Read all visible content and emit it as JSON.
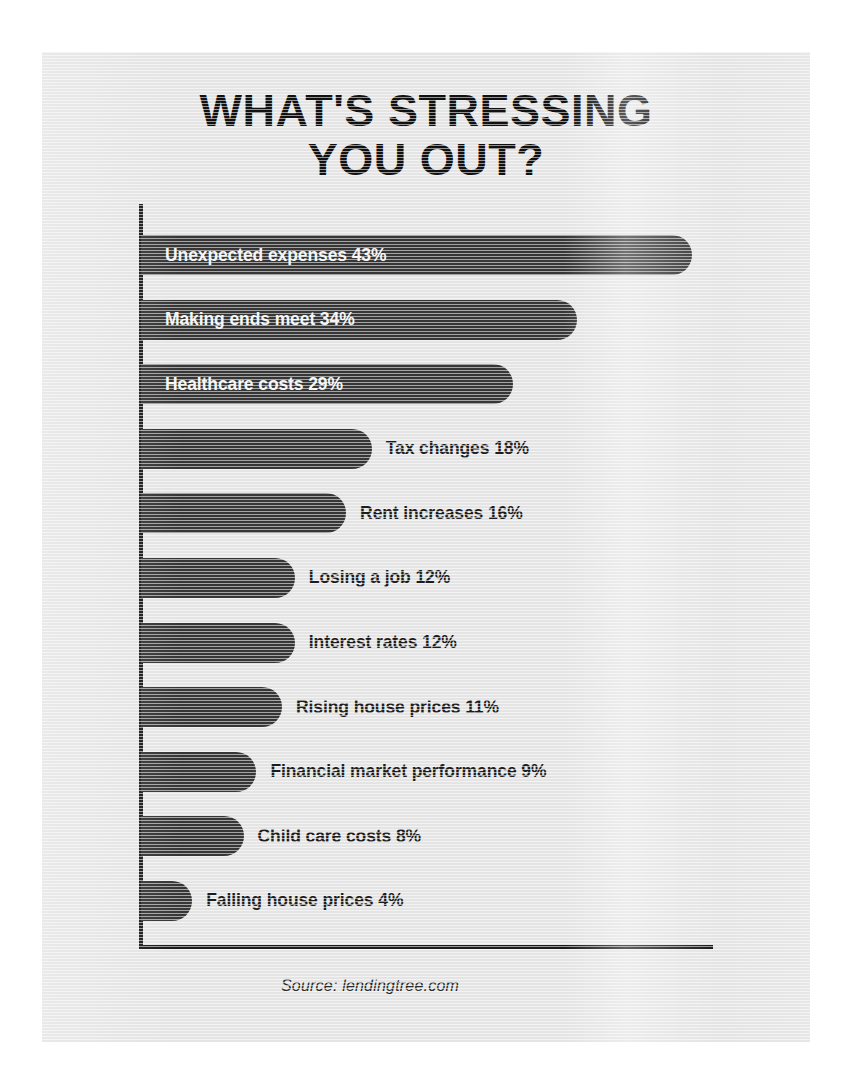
{
  "infographic": {
    "title_lines": [
      "WHAT'S STRESSING",
      "YOU OUT?"
    ],
    "source": "Source: lendingtree.com",
    "colors": {
      "panel_background": "#e4e4e4",
      "bar": "#363636",
      "axis": "#1a1a1a",
      "title_text": "#111111",
      "inside_label_text": "#f4f4f4",
      "outside_label_text": "#1c1c1c"
    }
  },
  "chart_data": {
    "type": "bar",
    "orientation": "horizontal",
    "title": "WHAT'S STRESSING YOU OUT?",
    "subtitle": "",
    "xlabel": "",
    "ylabel": "",
    "xlim": [
      0,
      48
    ],
    "grid": false,
    "legend": "none",
    "source": "Source: lendingtree.com",
    "value_suffix": "%",
    "categories": [
      "Unexpected expenses",
      "Making ends meet",
      "Healthcare costs",
      "Tax changes",
      "Rent increases",
      "Losing a job",
      "Interest rates",
      "Rising house prices",
      "Financial market performance",
      "Child care costs",
      "Falling house prices"
    ],
    "values": [
      43,
      34,
      29,
      18,
      16,
      12,
      12,
      11,
      9,
      8,
      4
    ],
    "bars": [
      {
        "label": "Unexpected expenses",
        "value": 43,
        "value_text": "43%",
        "label_position": "inside"
      },
      {
        "label": "Making ends meet",
        "value": 34,
        "value_text": "34%",
        "label_position": "inside"
      },
      {
        "label": "Healthcare costs",
        "value": 29,
        "value_text": "29%",
        "label_position": "inside"
      },
      {
        "label": "Tax changes",
        "value": 18,
        "value_text": "18%",
        "label_position": "outside"
      },
      {
        "label": "Rent increases",
        "value": 16,
        "value_text": "16%",
        "label_position": "outside"
      },
      {
        "label": "Losing a job",
        "value": 12,
        "value_text": "12%",
        "label_position": "outside"
      },
      {
        "label": "Interest rates",
        "value": 12,
        "value_text": "12%",
        "label_position": "outside"
      },
      {
        "label": "Rising house prices",
        "value": 11,
        "value_text": "11%",
        "label_position": "outside"
      },
      {
        "label": "Financial market performance",
        "value": 9,
        "value_text": "9%",
        "label_position": "outside"
      },
      {
        "label": "Child care costs",
        "value": 8,
        "value_text": "8%",
        "label_position": "outside"
      },
      {
        "label": "Falling house prices",
        "value": 4,
        "value_text": "4%",
        "label_position": "outside"
      }
    ]
  }
}
